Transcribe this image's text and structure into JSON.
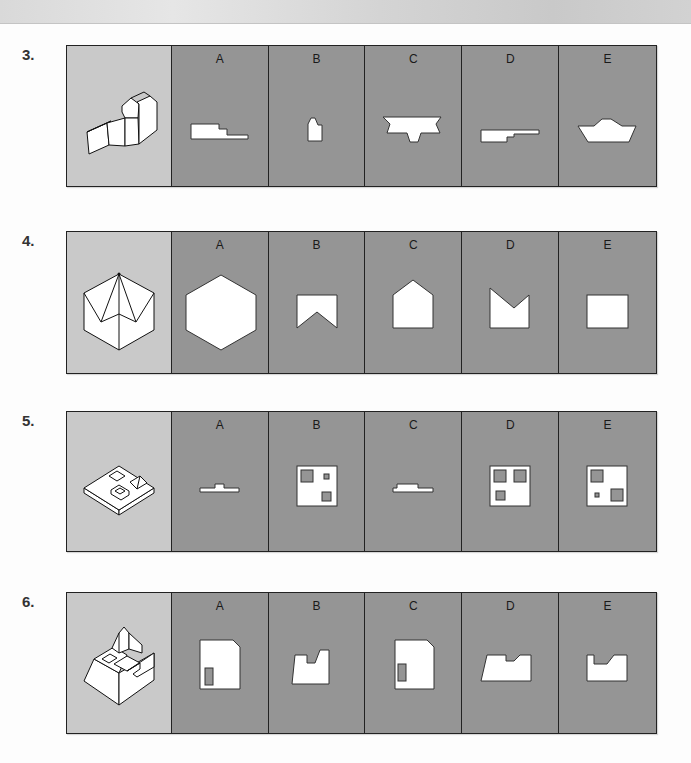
{
  "page": {
    "top_bar_color": "#d6d6d6",
    "stem_color": "#c9c9c9",
    "option_color": "#959595"
  },
  "questions": [
    {
      "number": "3.",
      "stem_icon": "isometric-block-figure",
      "options": [
        {
          "label": "A",
          "shape": "stepped-profile"
        },
        {
          "label": "B",
          "shape": "tall-notched-block"
        },
        {
          "label": "C",
          "shape": "flared-tee-profile"
        },
        {
          "label": "D",
          "shape": "long-stepped-profile"
        },
        {
          "label": "E",
          "shape": "boat-profile"
        }
      ]
    },
    {
      "number": "4.",
      "stem_icon": "hexagonal-pyramid-figure",
      "options": [
        {
          "label": "A",
          "shape": "hexagon"
        },
        {
          "label": "B",
          "shape": "notched-bottom-rectangle"
        },
        {
          "label": "C",
          "shape": "pentagon-house"
        },
        {
          "label": "D",
          "shape": "v-notched-top-rectangle"
        },
        {
          "label": "E",
          "shape": "rectangle"
        }
      ]
    },
    {
      "number": "5.",
      "stem_icon": "plate-with-recesses-figure",
      "options": [
        {
          "label": "A",
          "shape": "thin-raised-profile"
        },
        {
          "label": "B",
          "shape": "square-with-three-holes"
        },
        {
          "label": "C",
          "shape": "thin-raised-profile-2"
        },
        {
          "label": "D",
          "shape": "square-with-three-equal-holes"
        },
        {
          "label": "E",
          "shape": "square-with-mixed-holes"
        }
      ]
    },
    {
      "number": "6.",
      "stem_icon": "stepped-block-with-pyramid-figure",
      "options": [
        {
          "label": "A",
          "shape": "chamfered-rect-with-slot-left"
        },
        {
          "label": "B",
          "shape": "sloped-stepped-profile"
        },
        {
          "label": "C",
          "shape": "chamfered-rect-with-slot"
        },
        {
          "label": "D",
          "shape": "sloped-notched-profile"
        },
        {
          "label": "E",
          "shape": "notched-rectangle"
        }
      ]
    }
  ]
}
